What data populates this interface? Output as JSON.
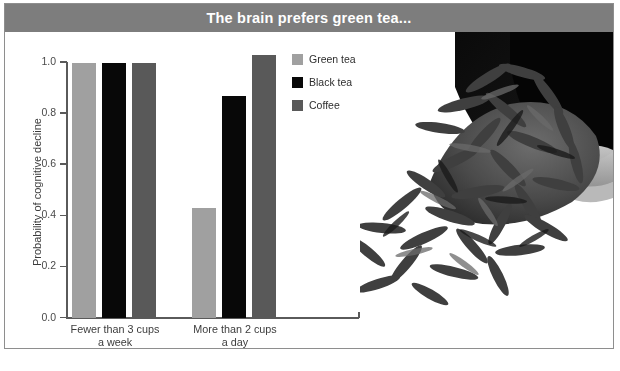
{
  "figure": {
    "title": "The brain prefers green tea...",
    "title_bar_color": "#7d7d7d",
    "border_color": "#8e8e8e",
    "background": "#ffffff"
  },
  "legend": {
    "position": "inside-top-center-right",
    "items": [
      {
        "label": "Green tea",
        "color": "#a0a0a0"
      },
      {
        "label": "Black tea",
        "color": "#080808"
      },
      {
        "label": "Coffee",
        "color": "#595959"
      }
    ]
  },
  "photo": {
    "alt": "grayscale photograph of dried green tea leaves spilling from a dark bowl",
    "name": "tea-leaves-photo"
  },
  "chart_data": {
    "type": "bar",
    "title": "The brain prefers green tea...",
    "xlabel": "",
    "ylabel": "Probability of cognitive decline",
    "categories": [
      "Fewer than 3 cups a week",
      "More than 2 cups a day"
    ],
    "category_lines": [
      [
        "Fewer than 3 cups",
        "a week"
      ],
      [
        "More than 2 cups",
        "a day"
      ]
    ],
    "series": [
      {
        "name": "Green tea",
        "color": "#a0a0a0",
        "values": [
          1.0,
          0.43
        ]
      },
      {
        "name": "Black tea",
        "color": "#080808",
        "values": [
          1.0,
          0.87
        ]
      },
      {
        "name": "Coffee",
        "color": "#595959",
        "values": [
          1.0,
          1.03
        ]
      }
    ],
    "ylim": [
      0.0,
      1.0
    ],
    "yticks": [
      0.0,
      0.2,
      0.4,
      0.6,
      0.8,
      1.0
    ],
    "ytick_labels": [
      "0.0",
      "0.2",
      "0.4",
      "0.6",
      "0.8",
      "1.0"
    ],
    "grid": false,
    "legend_position": "upper right inside"
  }
}
